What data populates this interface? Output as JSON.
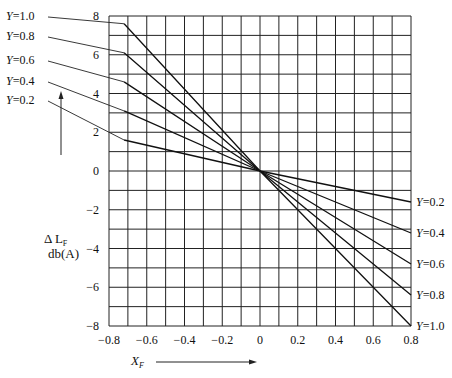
{
  "chart_data": {
    "type": "line",
    "title": "",
    "xlabel": "X_F",
    "ylabel": "ΔL_F db(A)",
    "xlim": [
      -0.8,
      0.8
    ],
    "ylim": [
      -8,
      8
    ],
    "grid": true,
    "x_ticks": [
      "-0.8",
      "-0.6",
      "-0.4",
      "-0.2",
      "0",
      "0.2",
      "0.4",
      "0.6",
      "0.8"
    ],
    "y_ticks": [
      "8",
      "6",
      "4",
      "2",
      "0",
      "-2",
      "-4",
      "-6",
      "-8"
    ],
    "x": [
      -0.72,
      0.0,
      0.8
    ],
    "series": [
      {
        "name": "Y=1.0",
        "slope": -10.0,
        "values": [
          7.6,
          0,
          -8.0
        ]
      },
      {
        "name": "Y=0.8",
        "slope": -8.0,
        "values": [
          6.1,
          0,
          -6.4
        ]
      },
      {
        "name": "Y=0.6",
        "slope": -6.0,
        "values": [
          4.6,
          0,
          -4.8
        ]
      },
      {
        "name": "Y=0.4",
        "slope": -4.0,
        "values": [
          3.1,
          0,
          -3.2
        ]
      },
      {
        "name": "Y=0.2",
        "slope": -2.0,
        "values": [
          1.6,
          0,
          -1.6
        ]
      }
    ],
    "legend": {
      "left": [
        "Y=1.0",
        "Y=0.8",
        "Y=0.6",
        "Y=0.4",
        "Y=0.2"
      ],
      "right": [
        "Y=0.2",
        "Y=0.4",
        "Y=0.6",
        "Y=0.8",
        "Y=1.0"
      ]
    }
  },
  "labels": {
    "ylabel_line1": "Δ L",
    "ylabel_sub": "F",
    "ylabel_line2": "db(A)",
    "xlabel_main": "X",
    "xlabel_sub": "F"
  }
}
